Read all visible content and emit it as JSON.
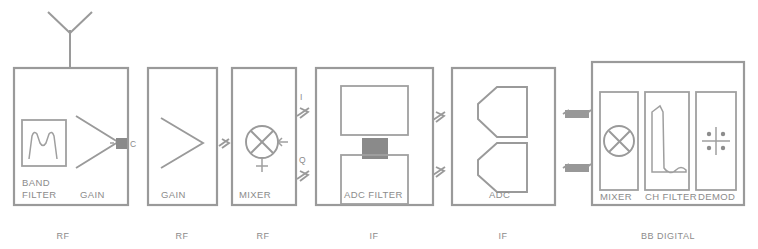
{
  "diagram": {
    "antenna_icon": "antenna-icon",
    "line_color": "#9a9a9a",
    "text_color": "#8b8b8b",
    "fill_color": "#8a8a8a"
  },
  "blocks": [
    {
      "id": "rf-front-end",
      "stage_label": "RF",
      "inner_labels": [
        "BAND",
        "FILTER",
        "GAIN"
      ],
      "components": [
        "band-filter-icon",
        "amplifier-icon"
      ]
    },
    {
      "id": "rf-gain",
      "stage_label": "RF",
      "inner_labels": [
        "GAIN"
      ],
      "components": [
        "amplifier-icon"
      ]
    },
    {
      "id": "rf-mixer",
      "stage_label": "RF",
      "inner_labels": [
        "MIXER"
      ],
      "components": [
        "mixer-icon"
      ]
    },
    {
      "id": "if-adc-filter",
      "stage_label": "IF",
      "inner_labels": [
        "ADC FILTER"
      ],
      "components": [
        "filter-box-upper",
        "coupling-block",
        "filter-box-lower"
      ]
    },
    {
      "id": "if-adc",
      "stage_label": "IF",
      "inner_labels": [
        "ADC"
      ],
      "components": [
        "adc-icon-i",
        "adc-icon-q"
      ]
    },
    {
      "id": "bb-digital",
      "stage_label": "BB DIGITAL",
      "inner_labels": [
        "MIXER",
        "CH FILTER",
        "DEMOD"
      ],
      "components": [
        "mixer-icon",
        "channel-filter-icon",
        "constellation-icon"
      ]
    }
  ],
  "connectors": [
    {
      "id": "conn-1",
      "type": "saw-filter",
      "label": "C",
      "between": [
        "rf-front-end",
        "rf-gain"
      ]
    },
    {
      "id": "conn-2",
      "type": "saw-filter",
      "label": "",
      "between": [
        "rf-gain",
        "rf-mixer"
      ]
    },
    {
      "id": "conn-3",
      "type": "saw-filter",
      "label": "I",
      "between": [
        "rf-mixer",
        "if-adc-filter"
      ]
    },
    {
      "id": "conn-4",
      "type": "saw-filter",
      "label": "Q",
      "between": [
        "rf-mixer",
        "if-adc-filter"
      ]
    },
    {
      "id": "conn-5",
      "type": "saw-filter",
      "label": "",
      "between": [
        "if-adc-filter",
        "if-adc"
      ]
    },
    {
      "id": "conn-6",
      "type": "saw-filter",
      "label": "",
      "between": [
        "if-adc-filter",
        "if-adc"
      ]
    },
    {
      "id": "conn-7",
      "type": "digital-bus",
      "label": "",
      "between": [
        "if-adc",
        "bb-digital"
      ]
    },
    {
      "id": "conn-8",
      "type": "digital-bus",
      "label": "",
      "between": [
        "if-adc",
        "bb-digital"
      ]
    }
  ],
  "labels": {
    "band": "BAND",
    "filter": "FILTER",
    "gain1": "GAIN",
    "gain2": "GAIN",
    "mixer_rf": "MIXER",
    "adc_filter": "ADC FILTER",
    "adc": "ADC",
    "mixer_bb": "MIXER",
    "ch_filter": "CH FILTER",
    "demod": "DEMOD",
    "stage_rf_1": "RF",
    "stage_rf_2": "RF",
    "stage_rf_3": "RF",
    "stage_if_1": "IF",
    "stage_if_2": "IF",
    "stage_bb": "BB DIGITAL",
    "iq_i": "I",
    "iq_q": "Q",
    "conn_c": "C"
  }
}
